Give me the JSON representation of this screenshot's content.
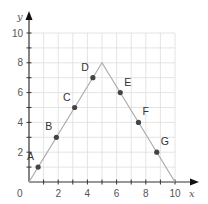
{
  "chart_data": {
    "type": "line",
    "title": "",
    "xlabel": "x",
    "ylabel": "y",
    "xlim": [
      0,
      10
    ],
    "ylim": [
      0,
      10
    ],
    "grid": true,
    "x_ticks": [
      0,
      2,
      4,
      6,
      8,
      10
    ],
    "y_ticks": [
      2,
      4,
      6,
      8,
      10
    ],
    "origin_label": "0",
    "series": [
      {
        "name": "piecewise line",
        "x": [
          0,
          5,
          10
        ],
        "y": [
          0,
          8,
          0
        ]
      }
    ],
    "points": [
      {
        "label": "A",
        "x": 0.625,
        "y": 1
      },
      {
        "label": "B",
        "x": 1.875,
        "y": 3
      },
      {
        "label": "C",
        "x": 3.125,
        "y": 5
      },
      {
        "label": "D",
        "x": 4.375,
        "y": 7
      },
      {
        "label": "E",
        "x": 6.25,
        "y": 6
      },
      {
        "label": "F",
        "x": 7.5,
        "y": 4
      },
      {
        "label": "G",
        "x": 8.75,
        "y": 2
      }
    ],
    "colors": {
      "axis": "#333333",
      "grid": "#dddddd",
      "line": "#aaaaaa",
      "point": "#444444"
    }
  }
}
